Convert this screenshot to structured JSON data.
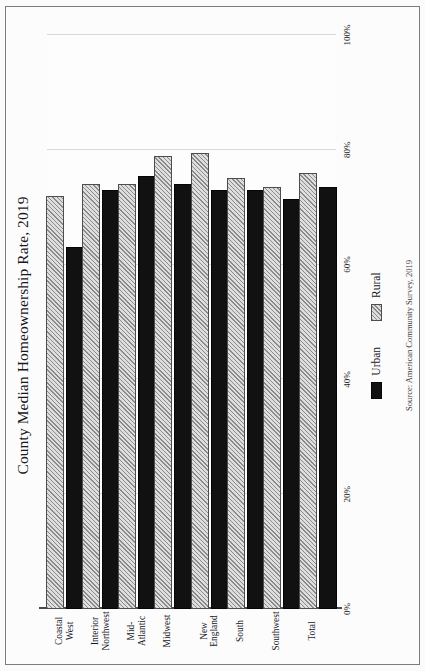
{
  "figure": {
    "title": "County Median Homeownership Rate, 2019",
    "source_note": "Source: American Community Survey, 2019"
  },
  "legend": {
    "position": "bottom-center",
    "items": [
      {
        "label": "Urban",
        "swatch": "solid-black-swatch"
      },
      {
        "label": "Rural",
        "swatch": "hatched-gray-swatch"
      }
    ]
  },
  "axis": {
    "tick_labels": [
      "0%",
      "20%",
      "40%",
      "60%",
      "80%",
      "100%"
    ],
    "tick_values": [
      0,
      20,
      40,
      60,
      80,
      100
    ]
  },
  "chart_data": {
    "type": "bar",
    "title": "County Median Homeownership Rate, 2019",
    "xlabel": "",
    "ylabel": "",
    "orientation": "vertical-grouped",
    "grid": true,
    "legend_position": "bottom-center",
    "ylim": [
      0,
      100
    ],
    "yticks": [
      0,
      20,
      40,
      60,
      80,
      100
    ],
    "ytick_labels": [
      "0%",
      "20%",
      "40%",
      "60%",
      "80%",
      "100%"
    ],
    "categories": [
      "Coastal West",
      "Interior Northwest",
      "Mid-Atlantic",
      "Midwest",
      "New England",
      "South",
      "Southwest",
      "Total"
    ],
    "series": [
      {
        "name": "Urban",
        "values": [
          63,
          73,
          75.5,
          74,
          73,
          73,
          71.5,
          73.5
        ]
      },
      {
        "name": "Rural",
        "values": [
          72,
          74,
          74,
          79,
          79.5,
          75,
          73.5,
          76
        ]
      }
    ]
  }
}
